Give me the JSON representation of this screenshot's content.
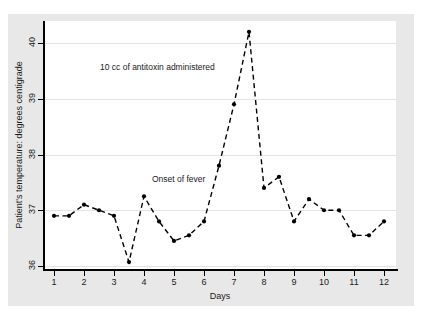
{
  "chart_data": {
    "type": "line",
    "title": "",
    "xlabel": "Days",
    "ylabel": "Patient's temperature:  degrees centigrade",
    "xlim": [
      0.6,
      12.4
    ],
    "ylim": [
      35.8,
      40.45
    ],
    "grid": true,
    "legend": null,
    "line_style": "dashed",
    "marker": "filled-circle",
    "series_color": "#000000",
    "grid_color": "#e4e4e4",
    "plot_background": "#ffffff",
    "figure_background": "#e8e8e8",
    "x_ticks": [
      "1",
      "2",
      "3",
      "4",
      "5",
      "6",
      "7",
      "8",
      "9",
      "10",
      "11",
      "12"
    ],
    "y_ticks": [
      "36",
      "37",
      "38",
      "39",
      "40"
    ],
    "x": [
      1,
      1.5,
      2,
      2.5,
      3,
      3.5,
      4,
      4.5,
      5,
      5.5,
      6,
      6.5,
      7,
      7.5,
      8,
      8.5,
      9,
      9.5,
      10,
      10.5,
      11,
      11.5,
      12
    ],
    "values": [
      36.9,
      36.9,
      37.1,
      37.0,
      36.9,
      36.07,
      37.25,
      36.8,
      36.45,
      36.55,
      36.8,
      37.8,
      38.9,
      40.2,
      37.4,
      37.6,
      36.8,
      37.2,
      37.0,
      37.0,
      36.55,
      36.55,
      36.8
    ],
    "annotations": [
      {
        "text": "10 cc of antitoxin administered",
        "x": 7.05,
        "y": 39.6
      },
      {
        "text": "Onset of fever",
        "x": 5.3,
        "y": 37.6
      }
    ]
  },
  "axis": {
    "x_title": "Days",
    "y_title": "Patient's temperature:  degrees centigrade"
  }
}
